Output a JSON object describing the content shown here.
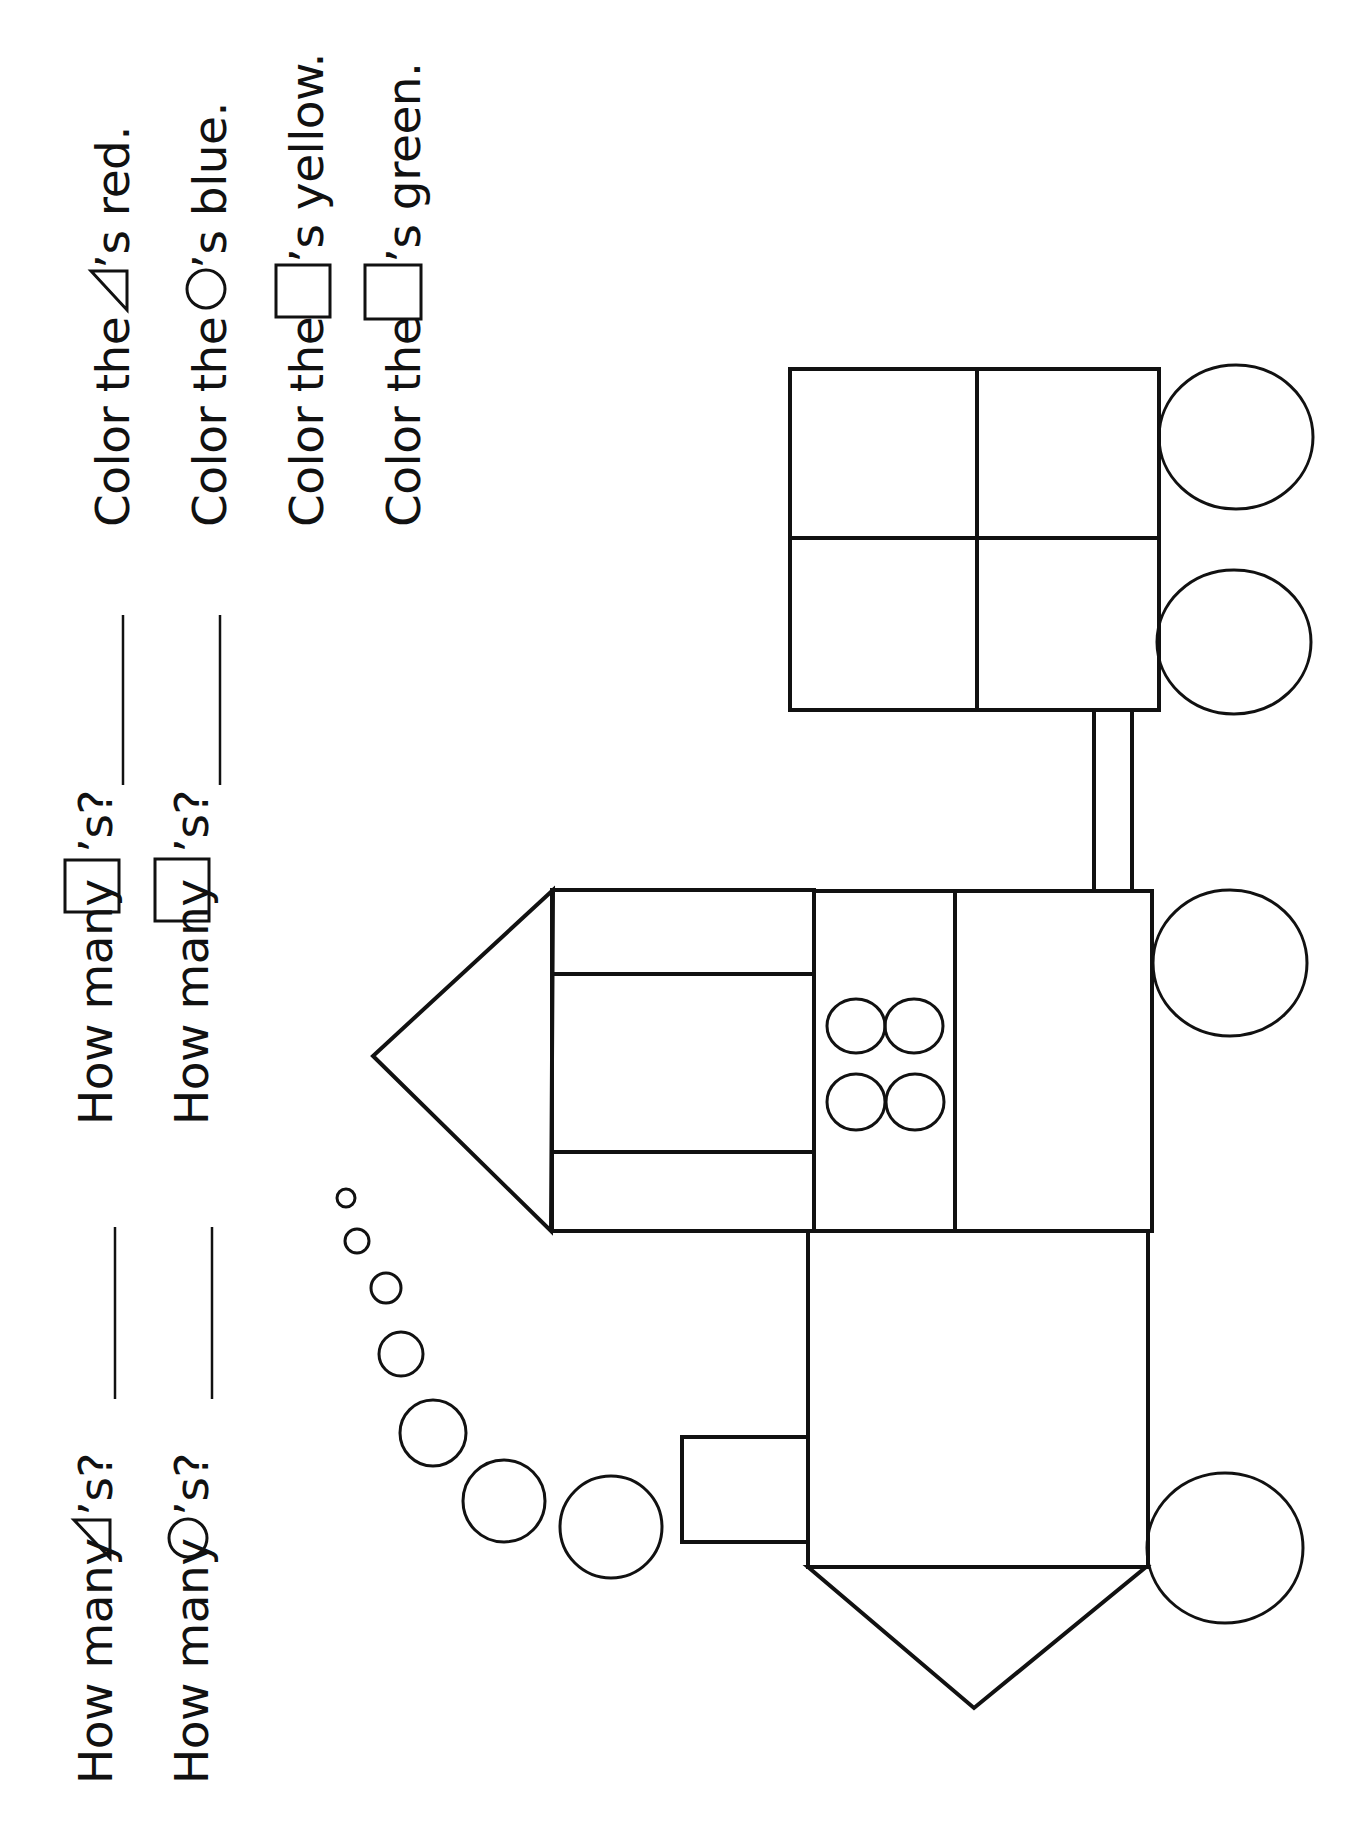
{
  "worksheet": {
    "questions": [
      {
        "id": "count-triangles",
        "prefix": "How many",
        "symbol": "triangle",
        "suffix": "’s?"
      },
      {
        "id": "count-circles",
        "prefix": "How many",
        "symbol": "circle",
        "suffix": "’s?"
      },
      {
        "id": "count-squares",
        "prefix": "How many",
        "symbol": "square",
        "suffix": "’s?"
      },
      {
        "id": "count-rectangles",
        "prefix": "How many",
        "symbol": "rectangle",
        "suffix": "’s?"
      }
    ],
    "instructions": [
      {
        "prefix": "Color the",
        "symbol": "triangle",
        "suffix": "’s red.",
        "color_name": "red"
      },
      {
        "prefix": "Color the",
        "symbol": "circle",
        "suffix": "’s blue.",
        "color_name": "blue"
      },
      {
        "prefix": "Color the",
        "symbol": "square",
        "suffix": "’s yellow.",
        "color_name": "yellow"
      },
      {
        "prefix": "Color the",
        "symbol": "rectangle",
        "suffix": "’s green.",
        "color_name": "green"
      }
    ],
    "answers": [
      "",
      "",
      "",
      ""
    ]
  },
  "drawing": {
    "subject": "train",
    "orientation": "rotated-90",
    "line_color": "#111111",
    "background": "#ffffff",
    "smoke_puffs": [
      {
        "cx": 346,
        "cy": 1198,
        "r": 9
      },
      {
        "cx": 357,
        "cy": 1241,
        "r": 12
      },
      {
        "cx": 386,
        "cy": 1288,
        "r": 15
      },
      {
        "cx": 401,
        "cy": 1354,
        "r": 22
      },
      {
        "cx": 433,
        "cy": 1433,
        "r": 33
      },
      {
        "cx": 504,
        "cy": 1501,
        "r": 41
      },
      {
        "cx": 611,
        "cy": 1527,
        "r": 51
      }
    ],
    "wheels": [
      {
        "cx": 1236,
        "cy": 437,
        "rx": 77,
        "ry": 72
      },
      {
        "cx": 1234,
        "cy": 642,
        "rx": 77,
        "ry": 72
      },
      {
        "cx": 1230,
        "cy": 963,
        "rx": 77,
        "ry": 73
      },
      {
        "cx": 1225,
        "cy": 1548,
        "rx": 78,
        "ry": 75
      }
    ],
    "cab_windows": [
      {
        "cx": 856,
        "cy": 1026,
        "rx": 29,
        "ry": 27
      },
      {
        "cx": 914,
        "cy": 1026,
        "rx": 29,
        "ry": 27
      },
      {
        "cx": 856,
        "cy": 1102,
        "rx": 29,
        "ry": 28
      },
      {
        "cx": 915,
        "cy": 1102,
        "rx": 29,
        "ry": 28
      }
    ]
  }
}
